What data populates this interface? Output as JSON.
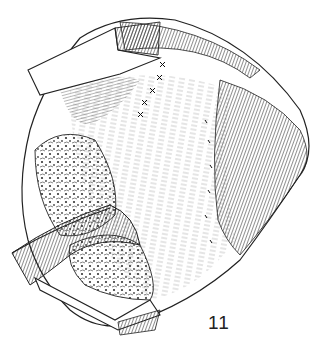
{
  "figure": {
    "number": "11",
    "colors": {
      "ink": "#1a1a1a",
      "background": "#ffffff"
    }
  }
}
